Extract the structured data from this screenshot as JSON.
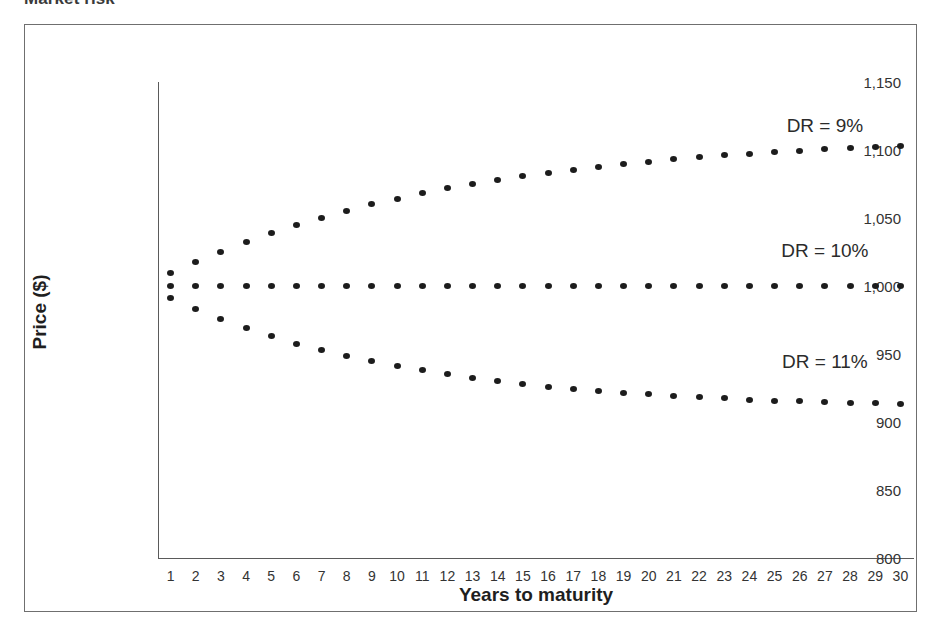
{
  "title": "Market risk",
  "chart_data": {
    "type": "scatter",
    "title": "Market risk",
    "xlabel": "Years to maturity",
    "ylabel": "Price ($)",
    "xlim": [
      0.5,
      30.5
    ],
    "ylim": [
      800,
      1150
    ],
    "grid": false,
    "legend_position": "inline-right",
    "x_tick_labels": [
      "1",
      "2",
      "3",
      "4",
      "5",
      "6",
      "7",
      "8",
      "9",
      "10",
      "11",
      "12",
      "13",
      "14",
      "15",
      "16",
      "17",
      "18",
      "19",
      "20",
      "21",
      "22",
      "23",
      "24",
      "25",
      "26",
      "27",
      "28",
      "29",
      "30"
    ],
    "y_tick_labels": [
      "800",
      "850",
      "900",
      "950",
      "1,000",
      "1,050",
      "1,100",
      "1,150"
    ],
    "y_tick_values": [
      800,
      850,
      900,
      950,
      1000,
      1050,
      1100,
      1150
    ],
    "x": [
      1,
      2,
      3,
      4,
      5,
      6,
      7,
      8,
      9,
      10,
      11,
      12,
      13,
      14,
      15,
      16,
      17,
      18,
      19,
      20,
      21,
      22,
      23,
      24,
      25,
      26,
      27,
      28,
      29,
      30
    ],
    "series": [
      {
        "name": "DR = 9%",
        "label": "DR = 9%",
        "label_x": 27,
        "label_y": 1118,
        "values": [
          1009.2,
          1017.6,
          1025.3,
          1032.4,
          1038.9,
          1044.9,
          1050.3,
          1055.4,
          1060.0,
          1064.2,
          1068.1,
          1071.7,
          1075.0,
          1078.0,
          1080.7,
          1083.3,
          1085.6,
          1087.7,
          1089.7,
          1091.5,
          1093.1,
          1094.6,
          1096.0,
          1097.3,
          1098.4,
          1099.5,
          1100.5,
          1101.4,
          1102.2,
          1102.7
        ]
      },
      {
        "name": "DR = 10%",
        "label": "DR = 10%",
        "label_x": 27,
        "label_y": 1026,
        "values": [
          1000,
          1000,
          1000,
          1000,
          1000,
          1000,
          1000,
          1000,
          1000,
          1000,
          1000,
          1000,
          1000,
          1000,
          1000,
          1000,
          1000,
          1000,
          1000,
          1000,
          1000,
          1000,
          1000,
          1000,
          1000,
          1000,
          1000,
          1000,
          1000,
          1000
        ]
      },
      {
        "name": "DR = 11%",
        "label": "DR = 11%",
        "label_x": 27,
        "label_y": 944,
        "values": [
          991.0,
          982.9,
          975.6,
          969.0,
          963.0,
          957.7,
          952.8,
          948.5,
          944.6,
          941.1,
          937.9,
          935.0,
          932.4,
          930.1,
          928.0,
          926.1,
          924.4,
          922.9,
          921.5,
          920.3,
          919.2,
          918.2,
          917.3,
          916.5,
          915.8,
          915.2,
          914.6,
          914.1,
          913.7,
          913.3
        ]
      }
    ]
  }
}
